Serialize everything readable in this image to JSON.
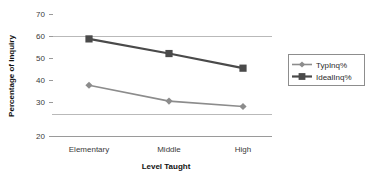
{
  "chart_data": {
    "type": "line",
    "title": "",
    "xlabel": "Level Taught",
    "ylabel": "Percentage of Inquiry",
    "categories": [
      "Elementary",
      "Middle",
      "High"
    ],
    "ylim": [
      20,
      70
    ],
    "yticks": [
      20,
      30,
      40,
      50,
      60,
      70
    ],
    "ytick_labels": [
      "20",
      "30",
      "40",
      "50",
      "60",
      "70"
    ],
    "gridlines": [
      20,
      30,
      60
    ],
    "grid": true,
    "legend_position": "right",
    "series": [
      {
        "name": "TypInq%",
        "values": [
          41,
          34.5,
          32.3
        ],
        "marker": "diamond",
        "color": "#8c8c8c"
      },
      {
        "name": "IdealInq%",
        "values": [
          60,
          54,
          48
        ],
        "marker": "square",
        "color": "#4a4a4a"
      }
    ]
  },
  "axes": {
    "y_title": "Percentage of Inquiry",
    "x_title": "Level Taught",
    "y_tick_0": "20",
    "y_tick_1": "30",
    "y_tick_2": "40",
    "y_tick_3": "50",
    "y_tick_4": "60",
    "y_tick_5": "70",
    "x_cat_0": "Elementary",
    "x_cat_1": "Middle",
    "x_cat_2": "High"
  },
  "legend": {
    "entry_0": "TypInq%",
    "entry_1": "IdealInq%"
  },
  "colors": {
    "series_typ": "#8c8c8c",
    "series_ideal": "#4a4a4a",
    "grid": "#b9b9b9",
    "axis": "#9a9a9a",
    "text": "#2b2b2b",
    "background": "#ffffff"
  }
}
